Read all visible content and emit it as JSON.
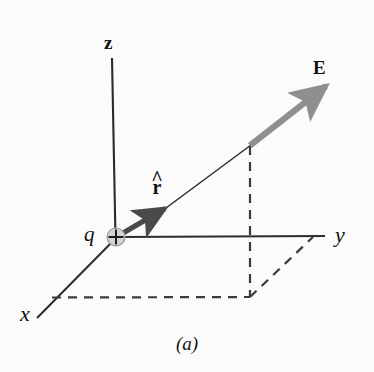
{
  "figure": {
    "caption": "(a)",
    "background_color": "#fbfbfb",
    "width": 374,
    "height": 372
  },
  "axes": {
    "z_label": "z",
    "y_label": "y",
    "x_label": "x",
    "axis_color": "#2b2b2b",
    "origin": {
      "x": 116,
      "y": 237
    },
    "z_tip": {
      "x": 112,
      "y": 58
    },
    "y_tip": {
      "x": 325,
      "y": 237
    },
    "x_tip": {
      "x": 37,
      "y": 318
    }
  },
  "charge": {
    "label": "q",
    "sign_symbol": "+",
    "fill_color": "#d2d2d2",
    "stroke_color": "#8c8c8c",
    "sign_color": "#1a1a1a",
    "radius": 9
  },
  "vectors": {
    "unit_vector": {
      "label": "r",
      "hat_symbol": "^",
      "display": "r-hat",
      "color": "#4a4a4a",
      "start": {
        "x": 118,
        "y": 236
      },
      "end": {
        "x": 170,
        "y": 205
      }
    },
    "field_vector": {
      "label": "E",
      "color": "#8f8f8f",
      "start": {
        "x": 250,
        "y": 145
      },
      "end": {
        "x": 332,
        "y": 81
      }
    },
    "connector_line": {
      "color": "#2b2b2b",
      "start": {
        "x": 168,
        "y": 207
      },
      "end": {
        "x": 250,
        "y": 146
      }
    }
  },
  "projection_lines": {
    "color": "#3a3a3a",
    "dash_pattern": "9 7",
    "vertical_drop": {
      "start": {
        "x": 250,
        "y": 146
      },
      "end": {
        "x": 250,
        "y": 297
      }
    },
    "horizontal_to_x_axis": {
      "start": {
        "x": 52,
        "y": 297
      },
      "end": {
        "x": 250,
        "y": 297
      }
    },
    "diagonal_to_y_axis": {
      "start": {
        "x": 250,
        "y": 297
      },
      "end": {
        "x": 313,
        "y": 237
      }
    }
  }
}
